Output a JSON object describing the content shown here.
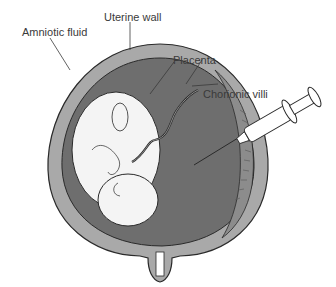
{
  "diagram": {
    "labels": {
      "uterine_wall": "Uterine wall",
      "amniotic_fluid": "Amniotic fluid",
      "placenta": "Placenta",
      "chorionic_villi": "Chorionic villi"
    },
    "colors": {
      "uterine_wall": "#a9a9a9",
      "amniotic_fluid": "#6e6e6e",
      "placenta": "#8c8c8c",
      "fetus": "#f4f4f4",
      "outline": "#2a2a2a",
      "syringe": "#ffffff"
    }
  }
}
